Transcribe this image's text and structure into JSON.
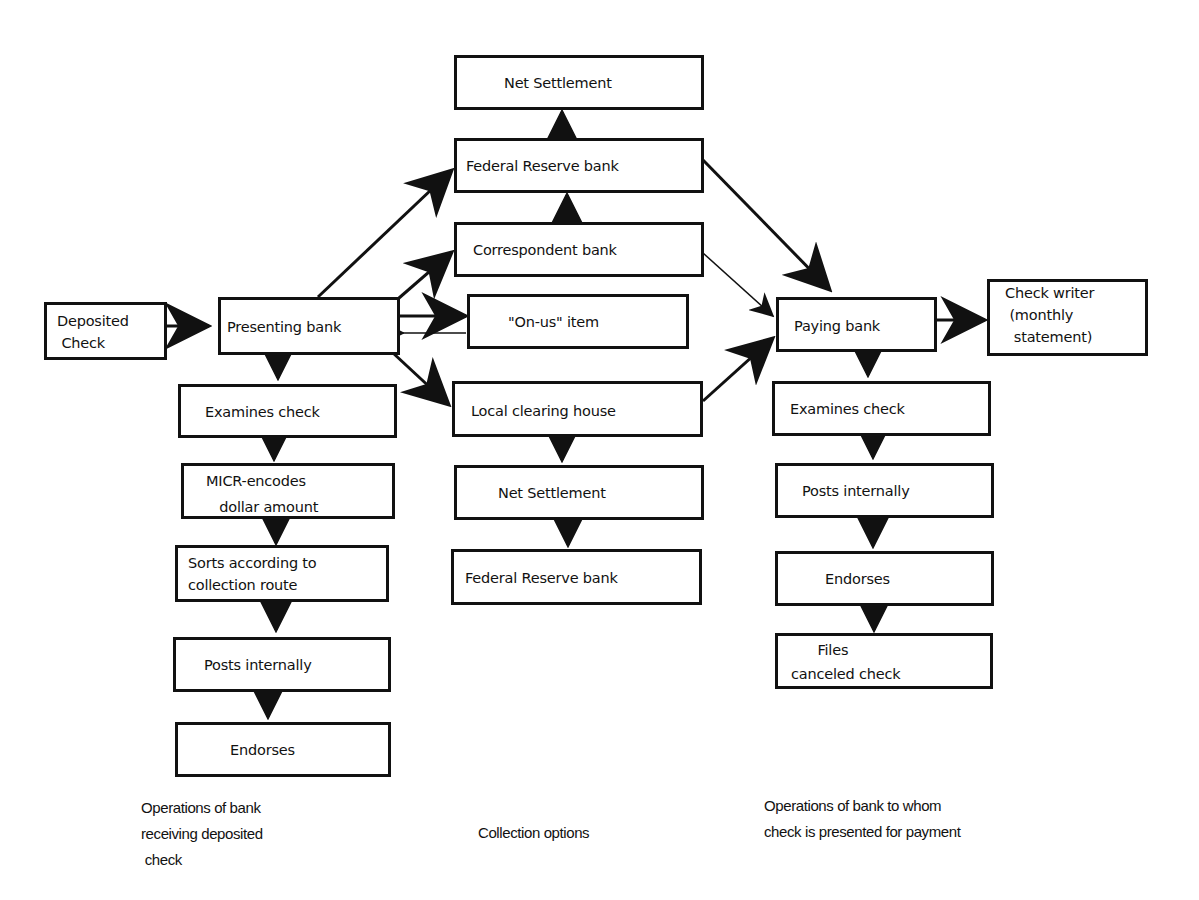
{
  "diagram": {
    "boxes": {
      "deposited_check": "Deposited\n Check",
      "presenting_bank": "Presenting bank",
      "net_settlement_top": "Net Settlement",
      "federal_reserve_top": "Federal Reserve bank",
      "correspondent_bank": "Correspondent bank",
      "on_us_item": "\"On-us\" item",
      "local_clearing_house": "Local clearing house",
      "net_settlement_bottom": "Net Settlement",
      "federal_reserve_bottom": "Federal Reserve bank",
      "left_examines_check": "Examines check",
      "micr_encodes": "MICR-encodes\n   dollar amount",
      "sorts": "Sorts according to\ncollection route",
      "left_posts_internally": "Posts internally",
      "left_endorses": "Endorses",
      "paying_bank": "Paying bank",
      "check_writer": "Check writer\n (monthly\n  statement)",
      "right_examines_check": "Examines check",
      "right_posts_internally": "Posts internally",
      "right_endorses": "Endorses",
      "files_canceled_check": "      Files\ncanceled check"
    },
    "captions": {
      "left": "Operations of bank\nreceiving deposited\n check",
      "middle": "Collection options",
      "right": "Operations of bank to whom\ncheck is presented for payment"
    },
    "colors": {
      "stroke": "#111111",
      "background": "#ffffff"
    }
  }
}
